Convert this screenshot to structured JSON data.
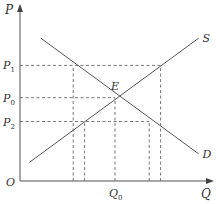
{
  "chart_data": {
    "type": "line",
    "title": "",
    "xlabel": "Q",
    "ylabel": "P",
    "origin_label": "O",
    "xlim": [
      0,
      10
    ],
    "ylim": [
      0,
      10
    ],
    "grid": false,
    "series": [
      {
        "name": "S",
        "label": "S",
        "points": [
          [
            0.5,
            1.1
          ],
          [
            9.4,
            8.4
          ]
        ]
      },
      {
        "name": "D",
        "label": "D",
        "points": [
          [
            1.1,
            8.4
          ],
          [
            9.4,
            1.6
          ]
        ]
      }
    ],
    "equilibrium": {
      "label": "E",
      "q": 5.0,
      "p": 4.9
    },
    "price_levels": [
      {
        "label": "P",
        "sub": "1",
        "p": 6.8
      },
      {
        "label": "P",
        "sub": "0",
        "p": 4.9
      },
      {
        "label": "P",
        "sub": "2",
        "p": 3.5
      }
    ],
    "quantity_levels": [
      {
        "label": "",
        "q": 2.8
      },
      {
        "label": "",
        "q": 3.4
      },
      {
        "label": "Q",
        "sub": "0",
        "q": 5.0
      },
      {
        "label": "",
        "q": 6.8
      },
      {
        "label": "",
        "q": 7.4
      }
    ],
    "guides": [
      {
        "from": [
          0,
          6.8
        ],
        "to": [
          7.4,
          6.8
        ]
      },
      {
        "from": [
          0,
          4.9
        ],
        "to": [
          5.0,
          4.9
        ]
      },
      {
        "from": [
          0,
          3.5
        ],
        "to": [
          6.8,
          3.5
        ]
      },
      {
        "from": [
          2.8,
          0
        ],
        "to": [
          2.8,
          6.8
        ]
      },
      {
        "from": [
          3.4,
          0
        ],
        "to": [
          3.4,
          3.5
        ]
      },
      {
        "from": [
          5.0,
          0
        ],
        "to": [
          5.0,
          4.9
        ]
      },
      {
        "from": [
          6.8,
          0
        ],
        "to": [
          6.8,
          3.5
        ]
      },
      {
        "from": [
          7.4,
          0
        ],
        "to": [
          7.4,
          6.8
        ]
      }
    ]
  }
}
